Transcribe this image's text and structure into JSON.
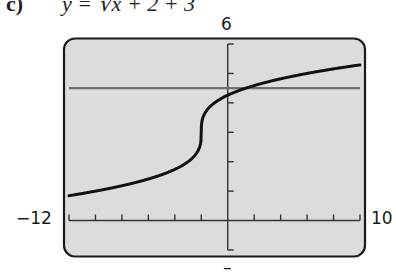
{
  "header": {
    "part_label": "c)",
    "equation": "y = ∛x + 2 + 3"
  },
  "window": {
    "xmin_label": "−12",
    "xmax_label": "10",
    "ymax_label": "6",
    "ymin_label": "–"
  },
  "colors": {
    "screen_bg": "#dcdcdc",
    "frame": "#1a1a1a",
    "axes": "#333333",
    "curve": "#111111",
    "hline": "#6e6e6e"
  },
  "chart_data": {
    "type": "line",
    "xlabel": "",
    "ylabel": "",
    "xlim": [
      -12,
      10
    ],
    "ylim": [
      -1,
      6
    ],
    "x_tick_step": 2,
    "y_tick_step": 1,
    "grid": false,
    "legend": null,
    "series": [
      {
        "name": "y = ∛(x + 2) + 3",
        "style": "thick black curve",
        "x": [
          -12,
          -10,
          -8,
          -6,
          -4,
          -3,
          -2.5,
          -2.1,
          -2,
          -1.9,
          -1.5,
          -1,
          0,
          2,
          4,
          6,
          8,
          10
        ],
        "y": [
          0.85,
          1.0,
          1.18,
          1.41,
          1.74,
          2.0,
          2.21,
          2.54,
          3.0,
          3.46,
          3.79,
          4.0,
          4.26,
          4.59,
          4.82,
          5.0,
          5.15,
          5.29
        ]
      },
      {
        "name": "horizontal line",
        "style": "gray horizontal line",
        "x": [
          -12,
          10
        ],
        "y": [
          4.5,
          4.5
        ]
      }
    ],
    "annotations": [
      "-12",
      "10",
      "6"
    ]
  }
}
